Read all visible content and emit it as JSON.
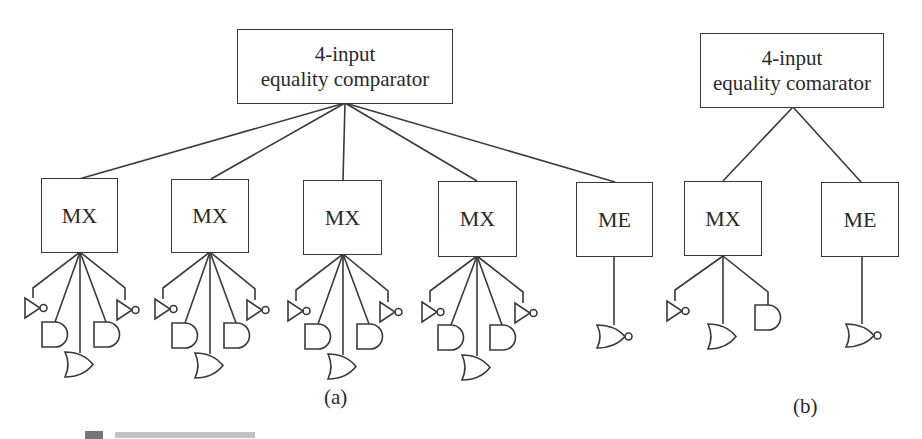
{
  "figure": {
    "panel_a": {
      "caption": "(a)",
      "comparator": {
        "line1": "4-input",
        "line2": "equality comparator"
      },
      "modules": [
        {
          "label": "MX",
          "gates": [
            "inverter",
            "and",
            "or",
            "and",
            "inverter"
          ]
        },
        {
          "label": "MX",
          "gates": [
            "inverter",
            "and",
            "or",
            "and",
            "inverter"
          ]
        },
        {
          "label": "MX",
          "gates": [
            "inverter",
            "and",
            "or",
            "and",
            "inverter"
          ]
        },
        {
          "label": "MX",
          "gates": [
            "inverter",
            "and",
            "or",
            "and",
            "inverter"
          ]
        },
        {
          "label": "ME",
          "gates": [
            "nor"
          ]
        }
      ]
    },
    "panel_b": {
      "caption": "(b)",
      "comparator": {
        "line1": "4-input",
        "line2": "equality comarator"
      },
      "modules": [
        {
          "label": "MX",
          "gates": [
            "inverter",
            "or",
            "and"
          ]
        },
        {
          "label": "ME",
          "gates": [
            "nor"
          ]
        }
      ]
    },
    "colors": {
      "stroke": "#3a3a3a",
      "background": "#ffffff",
      "text": "#2a2a2a"
    }
  }
}
